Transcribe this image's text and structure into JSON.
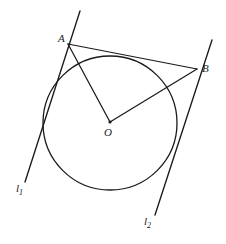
{
  "figure": {
    "canvas": {
      "width": 226,
      "height": 244,
      "background": "#ffffff"
    },
    "stroke_color": "#1a1a1a",
    "label_color": "#1a1a1a"
  },
  "labels": {
    "point_a": "A",
    "point_b": "B",
    "center_o": "O",
    "line_one": "l",
    "line_one_sub": "1",
    "line_two": "l",
    "line_two_sub": "2"
  },
  "geometry": {
    "circle": {
      "cx": 110,
      "cy": 123,
      "r": 67,
      "stroke_width": 1.3
    },
    "points": {
      "A": {
        "x": 68,
        "y": 44
      },
      "B": {
        "x": 197,
        "y": 69
      },
      "O": {
        "x": 110,
        "y": 122
      }
    },
    "segments": [
      {
        "name": "segment-AB",
        "x1": 68,
        "y1": 44,
        "x2": 197,
        "y2": 69
      },
      {
        "name": "segment-OA",
        "x1": 110,
        "y1": 122,
        "x2": 68,
        "y2": 44
      },
      {
        "name": "segment-OB",
        "x1": 110,
        "y1": 122,
        "x2": 197,
        "y2": 69
      }
    ],
    "tangent_lines": [
      {
        "name": "line-l1",
        "x1": 80,
        "y1": 11,
        "x2": 25,
        "y2": 182
      },
      {
        "name": "line-l2",
        "x1": 212,
        "y1": 40,
        "x2": 155,
        "y2": 215
      }
    ],
    "label_positions": {
      "A": {
        "left": 58,
        "top": 33
      },
      "B": {
        "left": 202,
        "top": 63
      },
      "O": {
        "left": 104,
        "top": 127
      },
      "l1": {
        "left": 16,
        "top": 183
      },
      "l2": {
        "left": 144,
        "top": 216
      }
    }
  }
}
